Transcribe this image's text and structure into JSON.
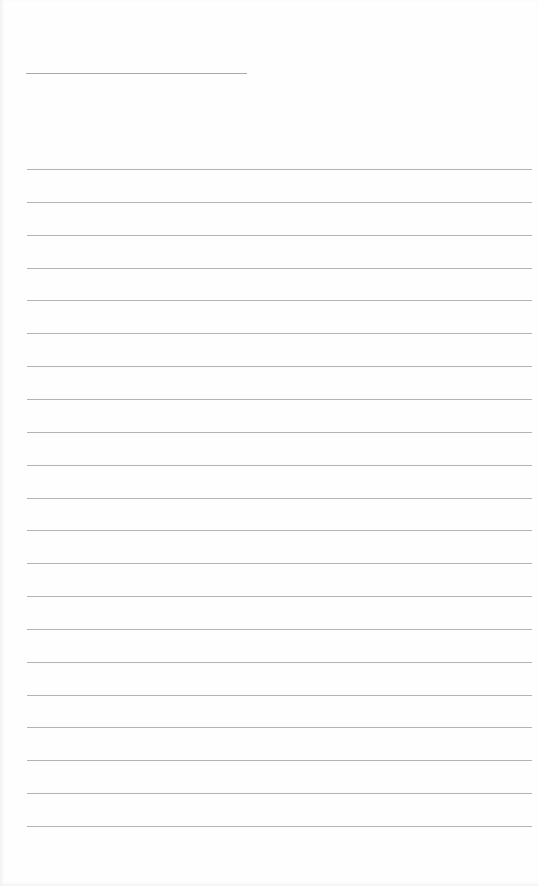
{
  "document": {
    "type": "lined-paper",
    "title_line": {
      "present": true,
      "text": ""
    },
    "ruled_line_count": 21,
    "ruled_line_start_y": 169,
    "ruled_line_spacing": 32.85,
    "line_color": "#b3b3b3",
    "background_color": "#fefefe"
  }
}
